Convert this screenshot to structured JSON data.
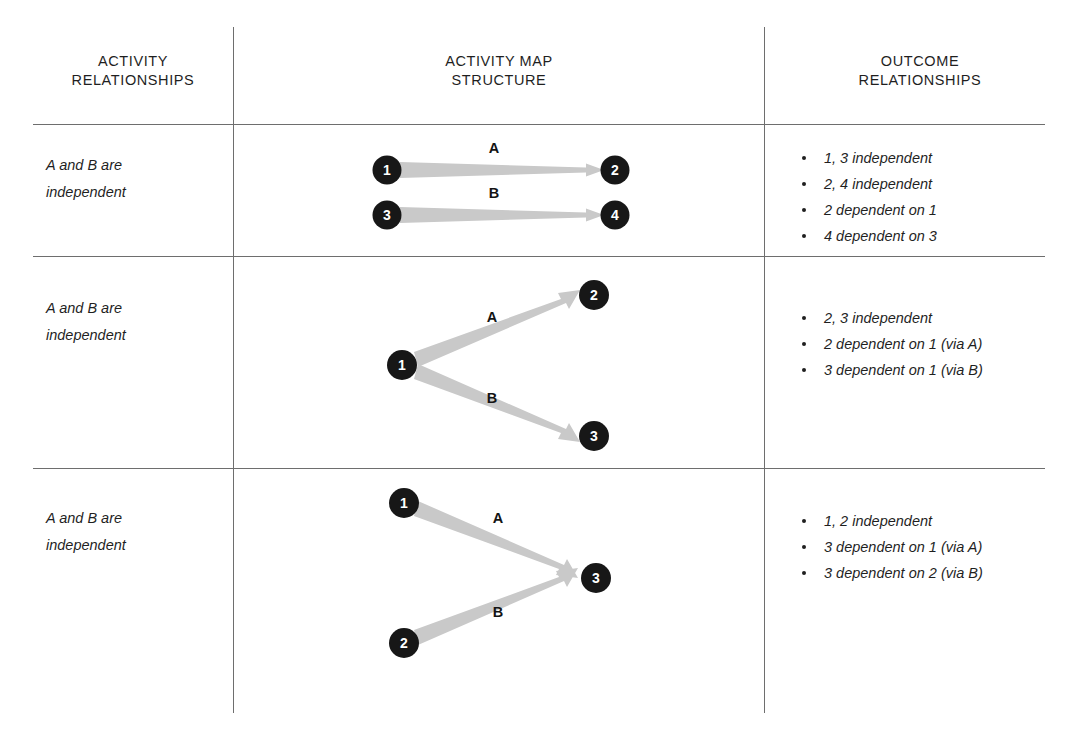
{
  "columns": [
    {
      "line1": "ACTIVITY",
      "line2": "RELATIONSHIPS"
    },
    {
      "line1": "ACTIVITY MAP",
      "line2": "STRUCTURE"
    },
    {
      "line1": "OUTCOME",
      "line2": "RELATIONSHIPS"
    }
  ],
  "colors": {
    "node_fill": "#171717",
    "node_text": "#ffffff",
    "arrow": "#c9c9c9",
    "rule": "#6e6e6e",
    "text": "#1f1f1f"
  },
  "rows": [
    {
      "relationship": {
        "line1": "A and B are",
        "line2": "independent"
      },
      "nodes": [
        {
          "id": "1",
          "cx": 33,
          "cy": 35
        },
        {
          "id": "2",
          "cx": 261,
          "cy": 35
        },
        {
          "id": "3",
          "cx": 33,
          "cy": 80
        },
        {
          "id": "4",
          "cx": 261,
          "cy": 80
        }
      ],
      "edges": [
        {
          "label": "A",
          "from": "1",
          "to": "2",
          "lx": 140,
          "ly": 18
        },
        {
          "label": "B",
          "from": "3",
          "to": "4",
          "lx": 140,
          "ly": 63
        }
      ],
      "outcomes": [
        "1, 3 independent",
        "2, 4 independent",
        "2 dependent on 1",
        "4 dependent on 3"
      ]
    },
    {
      "relationship": {
        "line1": "A and B are",
        "line2": "independent"
      },
      "nodes": [
        {
          "id": "1",
          "cx": 30,
          "cy": 97
        },
        {
          "id": "2",
          "cx": 222,
          "cy": 27
        },
        {
          "id": "3",
          "cx": 222,
          "cy": 168
        }
      ],
      "edges": [
        {
          "label": "A",
          "from": "1",
          "to": "2",
          "lx": 120,
          "ly": 54
        },
        {
          "label": "B",
          "from": "1",
          "to": "3",
          "lx": 120,
          "ly": 135
        }
      ],
      "outcomes": [
        "2, 3 independent",
        "2 dependent on 1 (via A)",
        "3 dependent on 1 (via B)"
      ]
    },
    {
      "relationship": {
        "line1": "A and B are",
        "line2": "independent"
      },
      "nodes": [
        {
          "id": "1",
          "cx": 30,
          "cy": 28
        },
        {
          "id": "2",
          "cx": 30,
          "cy": 168
        },
        {
          "id": "3",
          "cx": 222,
          "cy": 103
        }
      ],
      "edges": [
        {
          "label": "A",
          "from": "1",
          "to": "3",
          "lx": 124,
          "ly": 48
        },
        {
          "label": "B",
          "from": "2",
          "to": "3",
          "lx": 124,
          "ly": 142
        }
      ],
      "outcomes": [
        "1, 2 independent",
        "3 dependent on 1 (via A)",
        "3 dependent on 2 (via B)"
      ]
    }
  ]
}
